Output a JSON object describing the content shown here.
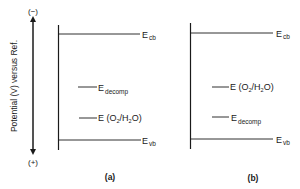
{
  "axis": {
    "label": "Potential (V) versus Ref.",
    "top_sign": "(−)",
    "bottom_sign": "(+)"
  },
  "panels": [
    {
      "caption": "(a)",
      "levels": [
        {
          "name": "E",
          "sub": "cb",
          "order": 1
        },
        {
          "name": "E",
          "sub": "decomp",
          "order": 2
        },
        {
          "name": "E (O",
          "sub2": "2",
          "mid": "/H",
          "sub3": "2",
          "tail": "O)",
          "order": 3
        },
        {
          "name": "E",
          "sub": "vb",
          "order": 4
        }
      ]
    },
    {
      "caption": "(b)",
      "levels": [
        {
          "name": "E",
          "sub": "cb",
          "order": 1
        },
        {
          "name": "E (O",
          "sub2": "2",
          "mid": "/H",
          "sub3": "2",
          "tail": "O)",
          "order": 2
        },
        {
          "name": "E",
          "sub": "decomp",
          "order": 3
        },
        {
          "name": "E",
          "sub": "vb",
          "order": 4
        }
      ]
    }
  ],
  "labels": {
    "E": "E",
    "cb": "cb",
    "vb": "vb",
    "decomp": "decomp",
    "o2h2o_prefix": "E (O",
    "two": "2",
    "slash_h": "/H",
    "o_close": "O)"
  }
}
